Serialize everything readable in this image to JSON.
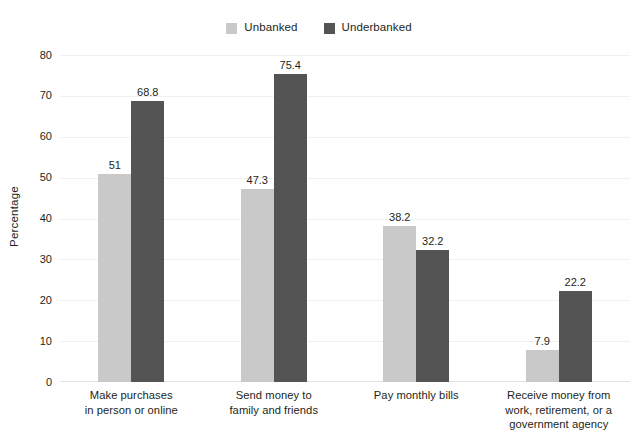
{
  "chart_data": {
    "type": "bar",
    "title": "",
    "subtitle": "",
    "xlabel": "",
    "ylabel": "Percentage",
    "ylim": [
      0,
      80
    ],
    "yticks": [
      80,
      70,
      60,
      50,
      40,
      30,
      20,
      10,
      0
    ],
    "grid": true,
    "legend_position": "top-center",
    "categories": [
      "Make purchases\nin person or online",
      "Send money to\nfamily and friends",
      "Pay monthly bills",
      "Receive money from\nwork, retirement, or a\ngovernment agency"
    ],
    "series": [
      {
        "name": "Unbanked",
        "color": "#c9c9c9",
        "values": [
          51,
          47.3,
          38.2,
          7.9
        ],
        "labels": [
          "51",
          "47.3",
          "38.2",
          "7.9"
        ]
      },
      {
        "name": "Underbanked",
        "color": "#545454",
        "values": [
          68.8,
          75.4,
          32.2,
          22.2
        ],
        "labels": [
          "68.8",
          "75.4",
          "32.2",
          "22.2"
        ]
      }
    ]
  },
  "legend": {
    "items": [
      {
        "label": "Unbanked",
        "swatch_color": "#c9c9c9",
        "swatch_icon": "square-swatch-icon"
      },
      {
        "label": "Underbanked",
        "swatch_color": "#545454",
        "swatch_icon": "square-swatch-icon"
      }
    ]
  },
  "axes": {
    "y_title": "Percentage",
    "y_ticks": [
      "80",
      "70",
      "60",
      "50",
      "40",
      "30",
      "20",
      "10",
      "0"
    ],
    "x_categories": [
      {
        "line1": "Make purchases",
        "line2": "in person or online",
        "line3": ""
      },
      {
        "line1": "Send money to",
        "line2": "family and friends",
        "line3": ""
      },
      {
        "line1": "Pay monthly bills",
        "line2": "",
        "line3": ""
      },
      {
        "line1": "Receive money from",
        "line2": "work, retirement, or a",
        "line3": "government agency"
      }
    ]
  },
  "colors": {
    "unbanked": "#c9c9c9",
    "underbanked": "#545454",
    "gridline": "#f0f0f0",
    "text": "#231f20",
    "background": "#ffffff"
  }
}
